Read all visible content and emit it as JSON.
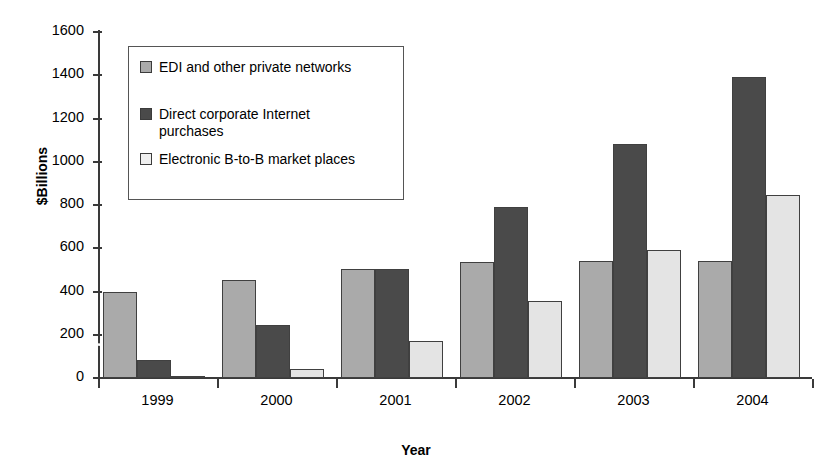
{
  "chart_data": {
    "type": "bar",
    "title": "",
    "xlabel": "Year",
    "ylabel": "$Billions",
    "categories": [
      "1999",
      "2000",
      "2001",
      "2002",
      "2003",
      "2004"
    ],
    "ylim": [
      0,
      1600
    ],
    "ytick_step": 200,
    "yticks": [
      "1600",
      "1400",
      "1200",
      "1000",
      "800",
      "600",
      "400",
      "200",
      "0"
    ],
    "grid": false,
    "legend_position": "upper-left-inside",
    "series": [
      {
        "name": "EDI and other private networks",
        "color": "#aaaaaa",
        "values": [
          400,
          455,
          505,
          535,
          540,
          540
        ]
      },
      {
        "name": "Direct corporate Internet purchases",
        "color": "#4a4a4a",
        "values": [
          85,
          245,
          505,
          790,
          1080,
          1390
        ]
      },
      {
        "name": "Electronic B-to-B market places",
        "color": "#e4e4e4",
        "values": [
          10,
          40,
          170,
          355,
          590,
          845
        ]
      }
    ],
    "annotations": [
      {
        "type": "overlay-line",
        "color": "#ffffff",
        "description": "white diagonal line sloping down from left across lower bars"
      }
    ]
  },
  "legend": {
    "items": [
      {
        "label": "EDI and other private networks",
        "swatch": "#aaaaaa"
      },
      {
        "label": "Direct corporate Internet\npurchases",
        "swatch": "#4a4a4a"
      },
      {
        "label": "Electronic B-to-B market places",
        "swatch": "#efefef"
      }
    ]
  },
  "axes": {
    "y_title": "$Billions",
    "x_title": "Year"
  }
}
